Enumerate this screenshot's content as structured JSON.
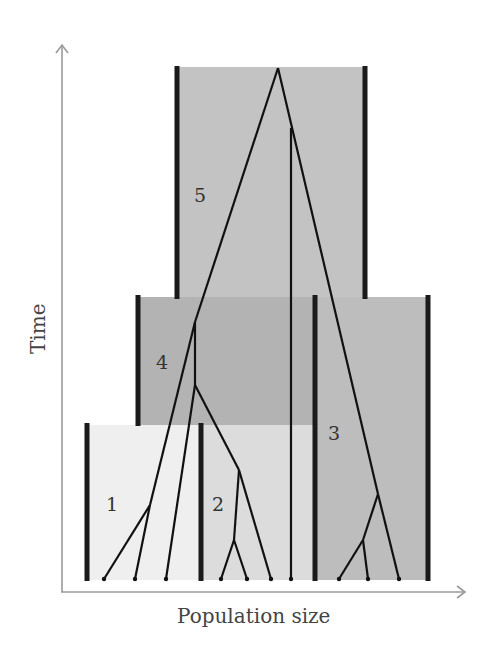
{
  "diagram": {
    "type": "population-tree / coalescent genealogy",
    "axes": {
      "x_label": "Population size",
      "y_label": "Time"
    },
    "colors": {
      "pop5_fill": "#c3c3c3",
      "pop4_fill": "#b3b3b3",
      "pop3_fill": "#bdbdbd",
      "pop2_fill": "#dedede",
      "pop1_fill": "#efefef",
      "bar": "#1a1a1a",
      "lineage": "#111111",
      "axis": "#999999"
    },
    "populations": [
      {
        "id": "1",
        "label": "1"
      },
      {
        "id": "2",
        "label": "2"
      },
      {
        "id": "3",
        "label": "3"
      },
      {
        "id": "4",
        "label": "4"
      },
      {
        "id": "5",
        "label": "5"
      }
    ],
    "sample_count": 10
  }
}
